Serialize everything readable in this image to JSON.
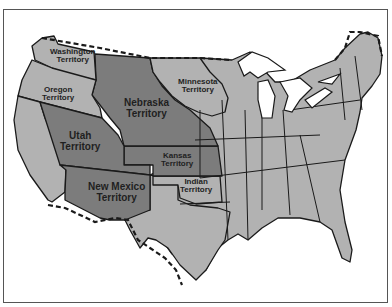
{
  "map": {
    "subject": "United States territories map",
    "territories": [
      {
        "id": "washington",
        "line1": "Washington",
        "line2": "Territory",
        "shade": "light"
      },
      {
        "id": "oregon",
        "line1": "Oregon",
        "line2": "Territory",
        "shade": "light"
      },
      {
        "id": "nebraska",
        "line1": "Nebraska",
        "line2": "Territory",
        "shade": "dark"
      },
      {
        "id": "minnesota",
        "line1": "Minnesota",
        "line2": "Territory",
        "shade": "light"
      },
      {
        "id": "utah",
        "line1": "Utah",
        "line2": "Territory",
        "shade": "dark"
      },
      {
        "id": "kansas",
        "line1": "Kansas",
        "line2": "Territory",
        "shade": "dark"
      },
      {
        "id": "new_mexico",
        "line1": "New Mexico",
        "line2": "Territory",
        "shade": "dark"
      },
      {
        "id": "indian",
        "line1": "Indian",
        "line2": "Territory",
        "shade": "light"
      }
    ],
    "colors": {
      "light_fill": "#b2b2b2",
      "dark_fill": "#7c7c7c",
      "border": "#1a1a1a",
      "background": "#ffffff"
    }
  }
}
